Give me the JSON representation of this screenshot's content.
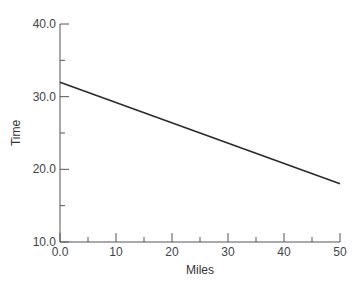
{
  "chart_data": {
    "type": "line",
    "title": "",
    "xlabel": "Miles",
    "ylabel": "Time",
    "xlim": [
      0,
      50
    ],
    "ylim": [
      10,
      40
    ],
    "x_major_ticks": [
      0,
      10,
      20,
      30,
      40,
      50
    ],
    "x_tick_labels": [
      "0.0",
      "10",
      "20",
      "30",
      "40",
      "50"
    ],
    "x_minor_ticks": [
      5,
      15,
      25,
      35,
      45
    ],
    "y_major_ticks": [
      10,
      20,
      30,
      40
    ],
    "y_tick_labels": [
      "10.0",
      "20.0",
      "30.0",
      "40.0"
    ],
    "y_minor_ticks": [
      15,
      25,
      35
    ],
    "grid": false,
    "legend": null,
    "series": [
      {
        "name": "Time vs Miles",
        "x": [
          0,
          50
        ],
        "y": [
          32,
          18
        ],
        "color": "#2a2a2a"
      }
    ]
  }
}
